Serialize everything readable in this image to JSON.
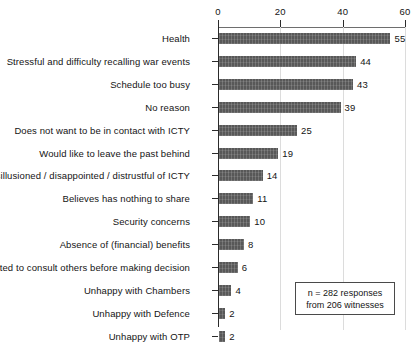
{
  "chart_data": {
    "type": "bar",
    "orientation": "horizontal",
    "title": "",
    "xlabel": "",
    "ylabel": "",
    "xlim": [
      0,
      60
    ],
    "xticks": [
      0,
      20,
      40,
      60
    ],
    "xtick_labels": [
      "0",
      "20",
      "40",
      "60"
    ],
    "grid": "vertical",
    "legend": "none",
    "bar_color": "#585858",
    "categories": [
      "Health",
      "Stressful and difficulty recalling war events",
      "Schedule too busy",
      "No reason",
      "Does not want to be in contact with ICTY",
      "Would like to leave the past behind",
      "Disillusioned / disappointed / distrustful of ICTY",
      "Believes has nothing to share",
      "Security concerns",
      "Absence of (financial) benefits",
      "Wanted to consult others before making decision",
      "Unhappy with Chambers",
      "Unhappy with Defence",
      "Unhappy with OTP"
    ],
    "values": [
      55,
      44,
      43,
      39,
      25,
      19,
      14,
      11,
      10,
      8,
      6,
      4,
      2,
      2
    ],
    "data_labels": [
      "55",
      "44",
      "43",
      "39",
      "25",
      "19",
      "14",
      "11",
      "10",
      "8",
      "6",
      "4",
      "2",
      "2"
    ],
    "annotations": [
      {
        "name": "sample-size-note",
        "lines": [
          "n = 282 responses",
          "from 206 witnesses"
        ],
        "boxed": true
      }
    ]
  },
  "note": {
    "line1": "n = 282 responses",
    "line2": "from 206 witnesses"
  }
}
